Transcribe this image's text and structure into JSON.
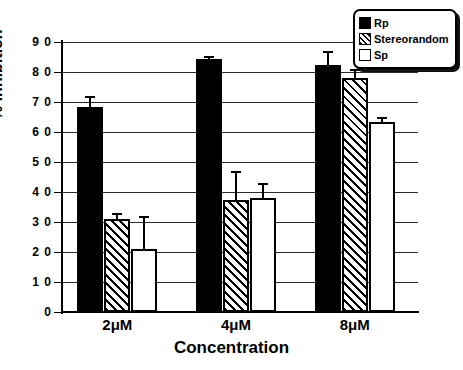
{
  "chart_data": {
    "type": "bar",
    "title": "",
    "xlabel": "Concentration",
    "ylabel": "% Inhibition",
    "categories": [
      "2μM",
      "4μM",
      "8μM"
    ],
    "ylim": [
      0,
      90
    ],
    "ytick_step": 10,
    "yticks": [
      0,
      10,
      20,
      30,
      40,
      50,
      60,
      70,
      80,
      90
    ],
    "ytick_labels": [
      "0",
      "1 0",
      "2 0",
      "3 0",
      "4 0",
      "5 0",
      "6 0",
      "7 0",
      "8 0",
      "9 0"
    ],
    "grid": true,
    "legend_position": "top-right",
    "series": [
      {
        "name": "Rp",
        "style": "solid-black",
        "color": "#000000",
        "values": [
          68.5,
          84.5,
          82.5
        ],
        "errors": [
          3.5,
          1.0,
          4.5
        ]
      },
      {
        "name": "Stereorandom",
        "style": "hatched",
        "color": "#000000",
        "values": [
          31.0,
          37.5,
          78.0
        ],
        "errors": [
          2.0,
          9.5,
          3.0
        ]
      },
      {
        "name": "Sp",
        "style": "open-white",
        "color": "#ffffff",
        "values": [
          21.0,
          38.0,
          63.5
        ],
        "errors": [
          11.0,
          5.0,
          1.5
        ]
      }
    ]
  },
  "axis": {
    "y_title": "% Inhibition",
    "x_title": "Concentration"
  },
  "legend": {
    "items": [
      {
        "label": "Rp",
        "swatch": "solid-black-swatch"
      },
      {
        "label": "Stereorandom",
        "swatch": "hatched-swatch"
      },
      {
        "label": "Sp",
        "swatch": "open-white-swatch"
      }
    ]
  }
}
